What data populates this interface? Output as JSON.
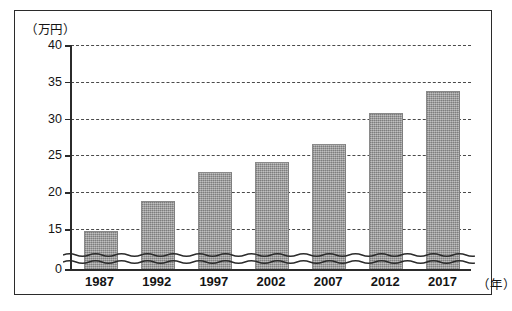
{
  "chart_data": {
    "type": "bar",
    "title": "",
    "subtitle": "",
    "xlabel": "（年）",
    "ylabel": "（万円）",
    "categories": [
      "1987",
      "1992",
      "1997",
      "2002",
      "2007",
      "2012",
      "2017"
    ],
    "values": [
      14.3,
      18.8,
      22.8,
      24.1,
      26.6,
      30.7,
      33.7
    ],
    "series": [
      {
        "name": "",
        "values": [
          14.3,
          18.8,
          22.8,
          24.1,
          26.6,
          30.7,
          33.7
        ]
      }
    ],
    "ylim": [
      0,
      40
    ],
    "y_ticks": [
      0,
      15,
      20,
      25,
      30,
      35,
      40
    ],
    "y_tick_labels": [
      "0",
      "15",
      "20",
      "25",
      "30",
      "35",
      "40"
    ],
    "grid": true,
    "grid_axis": "y",
    "grid_style": "dashed",
    "legend": false,
    "legend_position": "none",
    "axis_break": {
      "present": true,
      "style": "double-wavy",
      "between": [
        0,
        15
      ]
    },
    "bar_color": "#9b9b9b",
    "axis_color": "#2b2b2b",
    "gridline_color": "#4a4a4a",
    "background_color": "#ffffff",
    "frame": true
  }
}
